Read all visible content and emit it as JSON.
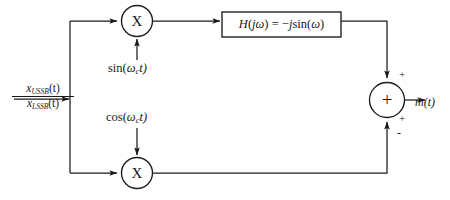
{
  "diagram": {
    "background_color": "#ffffff",
    "line_color": "#1a1a1a",
    "input": {
      "numerator": "x",
      "numerator_sub": "USSB",
      "numerator_arg": "(t)",
      "denominator": "x",
      "denominator_sub": "LSSB",
      "denominator_arg": "(t)"
    },
    "multipliers": [
      {
        "id": "upper-multiplier",
        "glyph": "X"
      },
      {
        "id": "lower-multiplier",
        "glyph": "X"
      }
    ],
    "carriers": {
      "upper": {
        "fn": "sin(",
        "omega": "ω",
        "sub": "c",
        "tail": "t)"
      },
      "lower": {
        "fn": "cos(",
        "omega": "ω",
        "sub": "c",
        "tail": "t)"
      }
    },
    "filter": {
      "lhs": "H",
      "lhs_open": "(",
      "j": "j",
      "omega": "ω",
      "lhs_close": ")",
      "equals": "=",
      "minus": "−",
      "j2": "j",
      "sin": "sin(",
      "omega2": "ω",
      "close": ")"
    },
    "summer": {
      "glyph": "+",
      "sign_top": "+",
      "sign_bottom_plus": "+",
      "sign_bottom_minus": "-"
    },
    "output": {
      "symbol": "m",
      "arg": "(t)"
    }
  }
}
